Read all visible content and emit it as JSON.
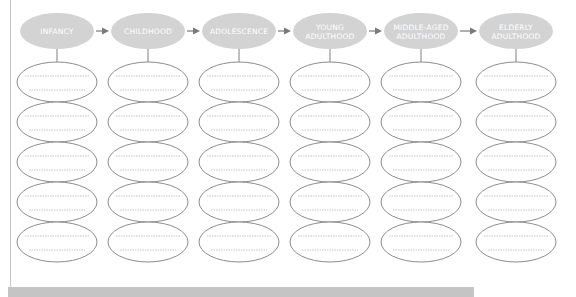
{
  "diagram": {
    "stages": [
      {
        "id": "infancy",
        "lines": [
          "INFANCY"
        ]
      },
      {
        "id": "childhood",
        "lines": [
          "CHILDHOOD"
        ]
      },
      {
        "id": "adolescence",
        "lines": [
          "ADOLESCENCE"
        ]
      },
      {
        "id": "young-adulthood",
        "lines": [
          "YOUNG",
          "ADULTHOOD"
        ]
      },
      {
        "id": "middle-aged-adulthood",
        "lines": [
          "MIDDLE-AGED",
          "ADULTHOOD"
        ]
      },
      {
        "id": "elderly-adulthood",
        "lines": [
          "ELDERLY",
          "ADULTHOOD"
        ]
      }
    ],
    "blank_ellipses_per_stage": 5,
    "lines_per_blank_ellipse": 2,
    "arrow_icon": "right-arrow-icon",
    "colors": {
      "stage_fill": "#d3d3d3",
      "stage_text": "#ffffff",
      "ellipse_stroke": "#8c8c8c",
      "dotted_line": "#b5b5b5",
      "connector": "#808080",
      "arrow": "#7a7a7a",
      "bottom_bar": "#c4c4c4"
    }
  }
}
